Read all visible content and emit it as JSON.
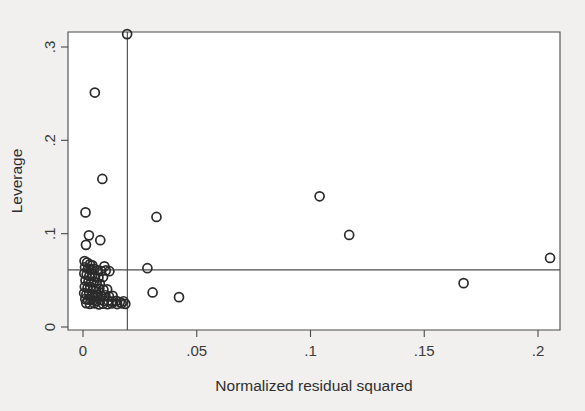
{
  "figure": {
    "background_color": "#f1f0ee",
    "plot_background_color": "#ffffff",
    "marker_color": "#2b2b2b",
    "line_color": "#4d4d4d",
    "frame_color": "#4a4a4a"
  },
  "chart_data": {
    "type": "scatter",
    "title": "",
    "xlabel": "Normalized residual squared",
    "ylabel": "Leverage",
    "xlim": [
      -0.0066,
      0.2163
    ],
    "ylim": [
      -0.0054,
      0.3204
    ],
    "xticks": [
      0,
      0.05,
      0.1,
      0.15,
      0.2
    ],
    "xticklabels": [
      "0",
      ".05",
      ".1",
      ".15",
      ".2"
    ],
    "yticks": [
      0,
      0.1,
      0.2,
      0.3
    ],
    "yticklabels": [
      "0",
      ".1",
      ".2",
      ".3"
    ],
    "grid": false,
    "legend": null,
    "marker_shape": "open-circle",
    "marker_size_px": 9,
    "reference_lines": [
      {
        "name": "mean-normalized-residual-squared",
        "orientation": "vertical",
        "value": 0.0195
      },
      {
        "name": "mean-leverage",
        "orientation": "horizontal",
        "value": 0.0612
      }
    ],
    "points": [
      {
        "x": 0.0194,
        "y": 0.3138
      },
      {
        "x": 0.0052,
        "y": 0.2512
      },
      {
        "x": 0.0085,
        "y": 0.1586
      },
      {
        "x": 0.0323,
        "y": 0.1179
      },
      {
        "x": 0.104,
        "y": 0.14
      },
      {
        "x": 0.117,
        "y": 0.0986
      },
      {
        "x": 0.2053,
        "y": 0.074
      },
      {
        "x": 0.1673,
        "y": 0.047
      },
      {
        "x": 0.0011,
        "y": 0.1228
      },
      {
        "x": 0.0026,
        "y": 0.0982
      },
      {
        "x": 0.0076,
        "y": 0.093
      },
      {
        "x": 0.0013,
        "y": 0.088
      },
      {
        "x": 0.0283,
        "y": 0.063
      },
      {
        "x": 0.0094,
        "y": 0.065
      },
      {
        "x": 0.0306,
        "y": 0.037
      },
      {
        "x": 0.0422,
        "y": 0.032
      },
      {
        "x": 0.0007,
        "y": 0.0706
      },
      {
        "x": 0.0018,
        "y": 0.069
      },
      {
        "x": 0.003,
        "y": 0.0672
      },
      {
        "x": 0.0041,
        "y": 0.066
      },
      {
        "x": 0.0009,
        "y": 0.064
      },
      {
        "x": 0.0022,
        "y": 0.0626
      },
      {
        "x": 0.0035,
        "y": 0.0614
      },
      {
        "x": 0.005,
        "y": 0.0622
      },
      {
        "x": 0.0064,
        "y": 0.0608
      },
      {
        "x": 0.008,
        "y": 0.06
      },
      {
        "x": 0.01,
        "y": 0.0606
      },
      {
        "x": 0.0116,
        "y": 0.0598
      },
      {
        "x": 0.0006,
        "y": 0.0574
      },
      {
        "x": 0.0016,
        "y": 0.056
      },
      {
        "x": 0.0028,
        "y": 0.0548
      },
      {
        "x": 0.004,
        "y": 0.0556
      },
      {
        "x": 0.0053,
        "y": 0.054
      },
      {
        "x": 0.0068,
        "y": 0.053
      },
      {
        "x": 0.0088,
        "y": 0.0536
      },
      {
        "x": 0.0011,
        "y": 0.0498
      },
      {
        "x": 0.0024,
        "y": 0.0486
      },
      {
        "x": 0.0036,
        "y": 0.0478
      },
      {
        "x": 0.0048,
        "y": 0.049
      },
      {
        "x": 0.006,
        "y": 0.047
      },
      {
        "x": 0.0074,
        "y": 0.0462
      },
      {
        "x": 0.0008,
        "y": 0.0432
      },
      {
        "x": 0.002,
        "y": 0.042
      },
      {
        "x": 0.0032,
        "y": 0.0428
      },
      {
        "x": 0.0044,
        "y": 0.041
      },
      {
        "x": 0.0058,
        "y": 0.0402
      },
      {
        "x": 0.0072,
        "y": 0.0412
      },
      {
        "x": 0.009,
        "y": 0.0398
      },
      {
        "x": 0.0106,
        "y": 0.0404
      },
      {
        "x": 0.0005,
        "y": 0.0362
      },
      {
        "x": 0.0015,
        "y": 0.035
      },
      {
        "x": 0.0027,
        "y": 0.0358
      },
      {
        "x": 0.0039,
        "y": 0.0344
      },
      {
        "x": 0.0052,
        "y": 0.0336
      },
      {
        "x": 0.0066,
        "y": 0.0346
      },
      {
        "x": 0.0082,
        "y": 0.0332
      },
      {
        "x": 0.0098,
        "y": 0.034
      },
      {
        "x": 0.0114,
        "y": 0.0328
      },
      {
        "x": 0.013,
        "y": 0.0334
      },
      {
        "x": 0.001,
        "y": 0.03
      },
      {
        "x": 0.0022,
        "y": 0.0292
      },
      {
        "x": 0.0034,
        "y": 0.0298
      },
      {
        "x": 0.0046,
        "y": 0.0286
      },
      {
        "x": 0.006,
        "y": 0.028
      },
      {
        "x": 0.0076,
        "y": 0.029
      },
      {
        "x": 0.0092,
        "y": 0.0278
      },
      {
        "x": 0.011,
        "y": 0.0284
      },
      {
        "x": 0.0128,
        "y": 0.0272
      },
      {
        "x": 0.0146,
        "y": 0.028
      },
      {
        "x": 0.0162,
        "y": 0.0268
      },
      {
        "x": 0.0178,
        "y": 0.0276
      },
      {
        "x": 0.0014,
        "y": 0.0256
      },
      {
        "x": 0.003,
        "y": 0.0248
      },
      {
        "x": 0.005,
        "y": 0.0254
      },
      {
        "x": 0.007,
        "y": 0.0242
      },
      {
        "x": 0.0088,
        "y": 0.025
      },
      {
        "x": 0.0108,
        "y": 0.0244
      },
      {
        "x": 0.0126,
        "y": 0.0252
      },
      {
        "x": 0.015,
        "y": 0.0246
      },
      {
        "x": 0.017,
        "y": 0.0254
      },
      {
        "x": 0.0186,
        "y": 0.0248
      }
    ]
  }
}
